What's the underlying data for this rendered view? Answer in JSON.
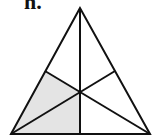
{
  "figure": {
    "label": "h.",
    "colors": {
      "stroke": "#111111",
      "shade": "#e4e4e4",
      "background": "#ffffff"
    },
    "points": {
      "apex": [
        80,
        8
      ],
      "bottom_left": [
        11,
        134
      ],
      "bottom_right": [
        150,
        134
      ],
      "mid_left": [
        45,
        71
      ],
      "mid_right": [
        115,
        71
      ],
      "mid_bottom": [
        80,
        134
      ],
      "centroid": [
        80,
        92
      ]
    },
    "shaded_regions": 2,
    "total_regions": 6
  }
}
